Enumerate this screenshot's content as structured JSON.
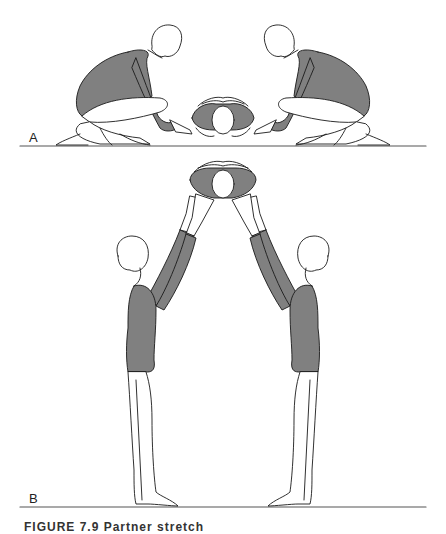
{
  "figure": {
    "panels": [
      {
        "label": "A",
        "description": "Two kneeling figures each holding the wrists of a third figure lying on its back between them"
      },
      {
        "label": "B",
        "description": "Two standing figures facing each other with raised arms supporting a third figure's arms overhead"
      }
    ],
    "caption": "FIGURE 7.9  Partner stretch",
    "colors": {
      "line": "#1a1a1a",
      "leotard": "#808080",
      "skin": "#ffffff",
      "floor": "#555555"
    }
  }
}
